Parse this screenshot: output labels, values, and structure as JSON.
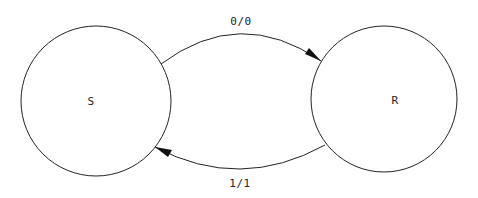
{
  "diagram": {
    "type": "state-machine",
    "states": [
      {
        "id": "S",
        "label": "S",
        "cx": 96,
        "cy": 101,
        "r": 75
      },
      {
        "id": "R",
        "label": "R",
        "cx": 384,
        "cy": 99,
        "r": 73
      }
    ],
    "transitions": [
      {
        "from": "S",
        "to": "R",
        "label": "0/0"
      },
      {
        "from": "R",
        "to": "S",
        "label": "1/1"
      }
    ],
    "stroke_color": "#222222"
  }
}
